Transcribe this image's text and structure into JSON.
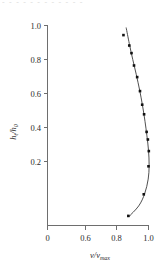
{
  "figure": {
    "width": 163,
    "height": 270,
    "background": "#ffffff",
    "ghost_text": "- - - - -     - - - - - -  -",
    "ink_color": "#1a1a1a",
    "axis_color": "#6e6e6e",
    "marker_color": "#111111",
    "curve_color": "#3b3b3b"
  },
  "chart_data": {
    "type": "scatter",
    "title": "",
    "subtitle": "",
    "xlabel": "v/v_max",
    "xlabel_parts": {
      "numerator": "v",
      "slash": "/",
      "denominator": "v",
      "subscript": "max"
    },
    "ylabel": "h_t/h_0",
    "ylabel_parts": {
      "numerator": "h",
      "num_sub": "t",
      "slash": "/",
      "denominator": "h",
      "den_sub": "0"
    },
    "xlim": [
      0.0,
      1.0
    ],
    "ylim": [
      0.0,
      1.0
    ],
    "x_axis_break": true,
    "x_break_note": "axis jumps from 0 to 0.6",
    "xticks": [
      0,
      0.6,
      0.8,
      1.0
    ],
    "xticklabels": [
      "0",
      "0.6",
      "0.8",
      "1.0"
    ],
    "yticks": [
      0.2,
      0.4,
      0.6,
      0.8,
      1.0
    ],
    "yticklabels": [
      "0.2",
      "0.4",
      "0.6",
      "0.8",
      "1.0"
    ],
    "grid": false,
    "legend": null,
    "legend_position": "none",
    "frame": "left-and-bottom-spines",
    "series": [
      {
        "name": "measured",
        "marker": "filled-square",
        "values": [
          {
            "x": 0.841,
            "y": 0.952
          },
          {
            "x": 0.878,
            "y": 0.9
          },
          {
            "x": 0.892,
            "y": 0.862
          },
          {
            "x": 0.908,
            "y": 0.8
          },
          {
            "x": 0.928,
            "y": 0.742
          },
          {
            "x": 0.946,
            "y": 0.672
          },
          {
            "x": 0.96,
            "y": 0.604
          },
          {
            "x": 0.972,
            "y": 0.556
          },
          {
            "x": 0.988,
            "y": 0.468
          },
          {
            "x": 0.996,
            "y": 0.43
          },
          {
            "x": 1.002,
            "y": 0.372
          },
          {
            "x": 1.0,
            "y": 0.296
          },
          {
            "x": 0.97,
            "y": 0.156
          },
          {
            "x": 0.872,
            "y": 0.048
          }
        ]
      },
      {
        "name": "fit-curve",
        "marker": "none",
        "values": [
          {
            "x": 0.858,
            "y": 0.99
          },
          {
            "x": 0.878,
            "y": 0.91
          },
          {
            "x": 0.9,
            "y": 0.83
          },
          {
            "x": 0.922,
            "y": 0.756
          },
          {
            "x": 0.944,
            "y": 0.676
          },
          {
            "x": 0.962,
            "y": 0.6
          },
          {
            "x": 0.978,
            "y": 0.52
          },
          {
            "x": 0.99,
            "y": 0.448
          },
          {
            "x": 1.0,
            "y": 0.376
          },
          {
            "x": 1.004,
            "y": 0.3
          },
          {
            "x": 0.998,
            "y": 0.232
          },
          {
            "x": 0.976,
            "y": 0.16
          },
          {
            "x": 0.938,
            "y": 0.098
          },
          {
            "x": 0.872,
            "y": 0.042
          }
        ]
      }
    ]
  }
}
